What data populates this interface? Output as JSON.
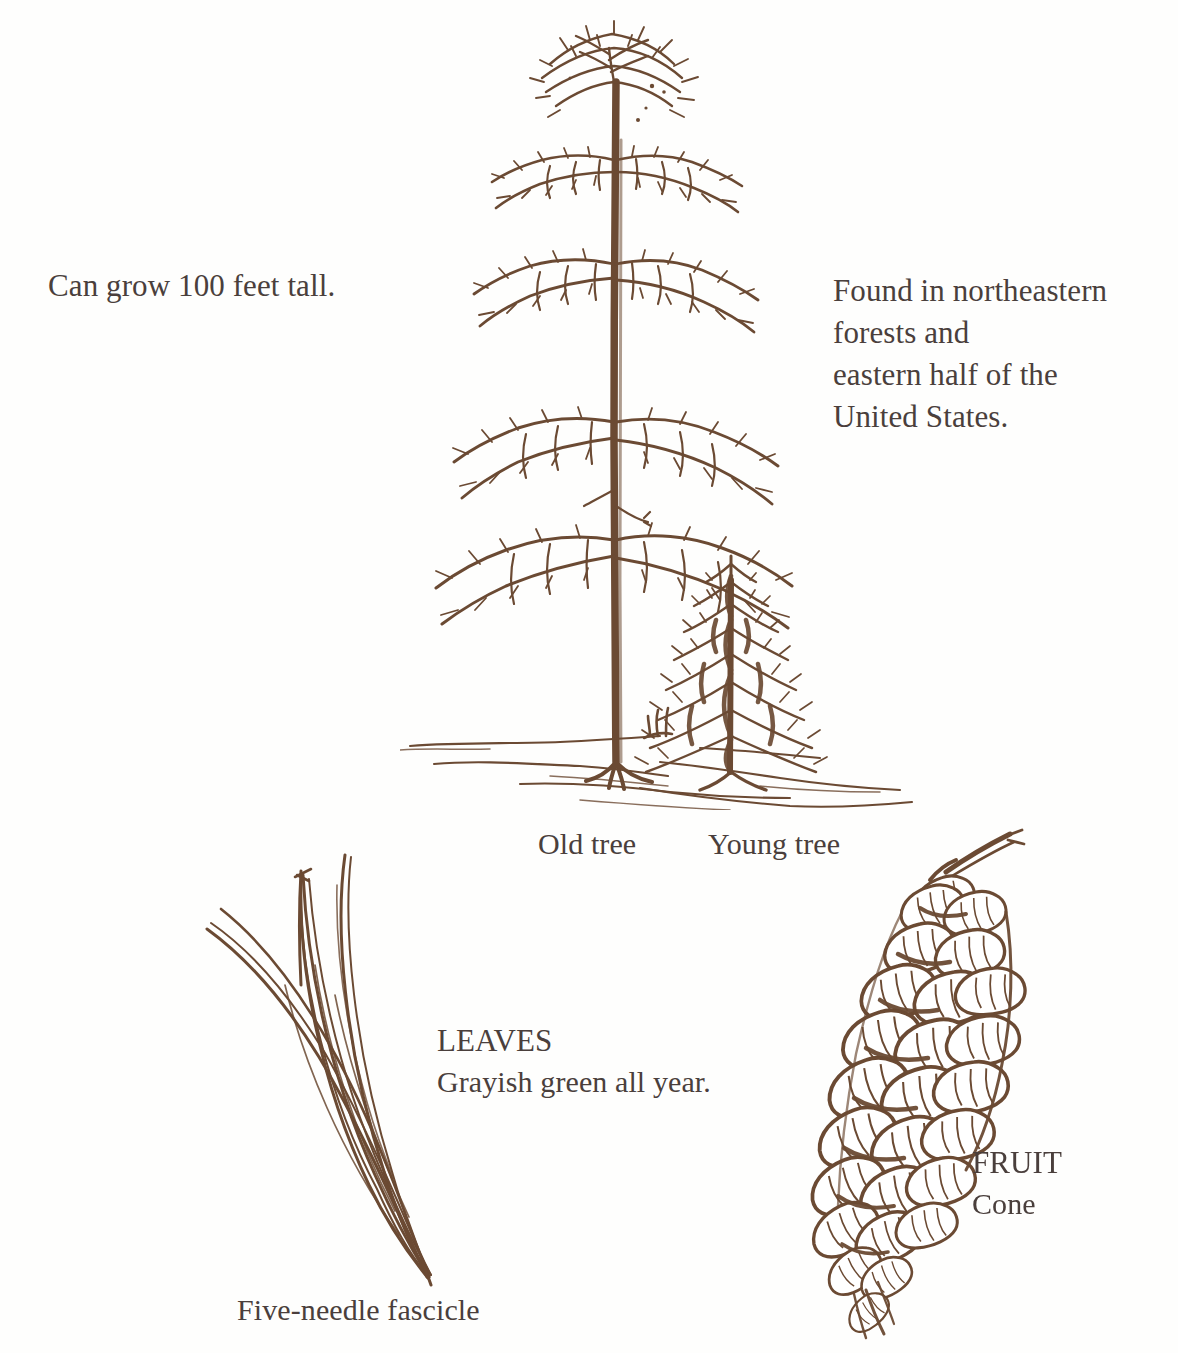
{
  "page": {
    "background_color": "#fefefd",
    "ink_color": "#6b4a33",
    "text_color": "#4a3f3c"
  },
  "labels": {
    "height": "Can grow 100 feet tall.",
    "range": "Found in northeastern\nforests and\neastern half of the\nUnited States.",
    "old_tree": "Old tree",
    "young_tree": "Young tree",
    "leaves_heading": "LEAVES",
    "leaves_description": "Grayish green all year.",
    "fruit_heading": "FRUIT",
    "fruit_description": "Cone",
    "fascicle": "Five-needle fascicle"
  },
  "illustrations": {
    "trees": {
      "name": "tree-habit-drawing",
      "parts": [
        "old-tree",
        "young-tree",
        "ground-line"
      ]
    },
    "needles": {
      "name": "five-needle-fascicle-drawing",
      "needle_count": 5
    },
    "cone": {
      "name": "pine-cone-drawing",
      "scale_rows": 8
    }
  }
}
